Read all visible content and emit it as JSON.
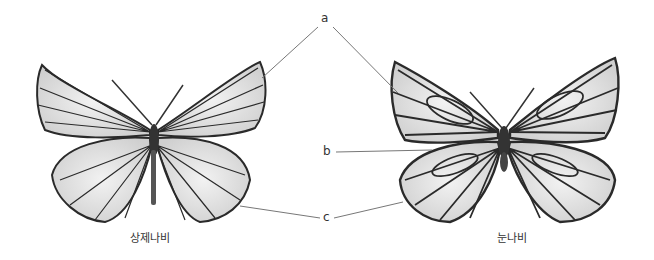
{
  "figure": {
    "labels": {
      "a": "a",
      "b": "b",
      "c": "c"
    },
    "specimens": [
      {
        "name": "상제나비",
        "position": "left"
      },
      {
        "name": "눈나비",
        "position": "right"
      }
    ],
    "colors": {
      "vein": "#2a2a2a",
      "wing": "#e6e6e6",
      "line": "#777777",
      "text": "#333333"
    }
  }
}
